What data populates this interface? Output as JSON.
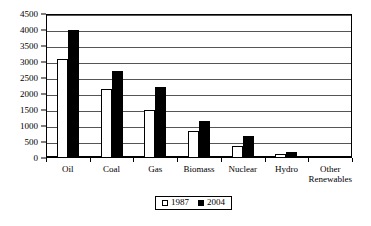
{
  "chart_data": {
    "type": "bar",
    "title": "",
    "subtitle": "",
    "xlabel": "",
    "ylabel": "",
    "ylim": [
      0,
      4500
    ],
    "ytick_step": 500,
    "yticks": [
      "0",
      "500",
      "1000",
      "1500",
      "2000",
      "2500",
      "3000",
      "3500",
      "4000",
      "4500"
    ],
    "grid": true,
    "legend_position": "bottom",
    "categories": [
      "Oil",
      "Coal",
      "Gas",
      "Biomass",
      "Nuclear",
      "Hydro",
      "Other\nRenewables"
    ],
    "series": [
      {
        "name": "1987",
        "color": "#ffffff",
        "values": [
          3100,
          2160,
          1500,
          830,
          380,
          140,
          10
        ]
      },
      {
        "name": "2004",
        "color": "#000000",
        "values": [
          4000,
          2720,
          2230,
          1150,
          680,
          190,
          30
        ]
      }
    ]
  },
  "legend": {
    "items": [
      {
        "label": "1987",
        "swatch": "white-square"
      },
      {
        "label": "2004",
        "swatch": "black-square"
      }
    ]
  }
}
